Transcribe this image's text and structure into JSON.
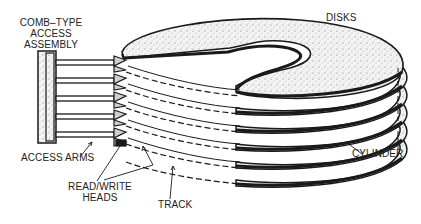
{
  "diagram": {
    "labels": {
      "comb_line1": "COMB–TYPE",
      "comb_line2": "ACCESS",
      "comb_line3": "ASSEMBLY",
      "disks": "DISKS",
      "access_arms": "ACCESS ARMS",
      "rw_line1": "READ/WRITE",
      "rw_line2": "HEADS",
      "track": "TRACK",
      "cylinder": "CYLINDER"
    },
    "components": [
      "comb-type access assembly",
      "access arms",
      "read/write heads",
      "disks",
      "track",
      "cylinder"
    ],
    "disk_count": 6,
    "arm_count": 5,
    "colors": {
      "ink": "#1a1a1a",
      "stipple": "#9a9a9a",
      "background": "#ffffff"
    }
  }
}
